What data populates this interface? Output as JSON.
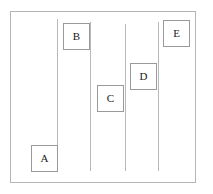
{
  "figure": {
    "title": "",
    "canvas": {
      "width": 213,
      "height": 194,
      "background": "#ffffff"
    },
    "frame": {
      "name": "outer-border",
      "x": 10,
      "y": 11,
      "width": 186,
      "height": 172,
      "stroke": "#b5b5b5",
      "stroke_width": 1
    },
    "lane_lines": [
      {
        "id": "line-1",
        "x": 57,
        "y_top": 19,
        "y_bottom": 171,
        "stroke": "#b8b8b8"
      },
      {
        "id": "line-2",
        "x": 90,
        "y_top": 22,
        "y_bottom": 171,
        "stroke": "#b8b8b8"
      },
      {
        "id": "line-3",
        "x": 125,
        "y_top": 24,
        "y_bottom": 171,
        "stroke": "#b8b8b8"
      },
      {
        "id": "line-4",
        "x": 158,
        "y_top": 22,
        "y_bottom": 171,
        "stroke": "#b8b8b8"
      }
    ],
    "nodes": [
      {
        "id": "node-a",
        "label": "A",
        "x": 31,
        "y": 145,
        "width": 27,
        "height": 27
      },
      {
        "id": "node-b",
        "label": "B",
        "x": 63,
        "y": 23,
        "width": 27,
        "height": 27
      },
      {
        "id": "node-c",
        "label": "C",
        "x": 97,
        "y": 85,
        "width": 27,
        "height": 27
      },
      {
        "id": "node-d",
        "label": "D",
        "x": 130,
        "y": 63,
        "width": 27,
        "height": 27
      },
      {
        "id": "node-e",
        "label": "E",
        "x": 163,
        "y": 20,
        "width": 27,
        "height": 27
      }
    ],
    "colors": {
      "node_border": "#9a9a9a",
      "node_fill": "#ffffff",
      "line": "#b8b8b8",
      "frame": "#b5b5b5",
      "label_text": "#1a1a1a"
    }
  }
}
